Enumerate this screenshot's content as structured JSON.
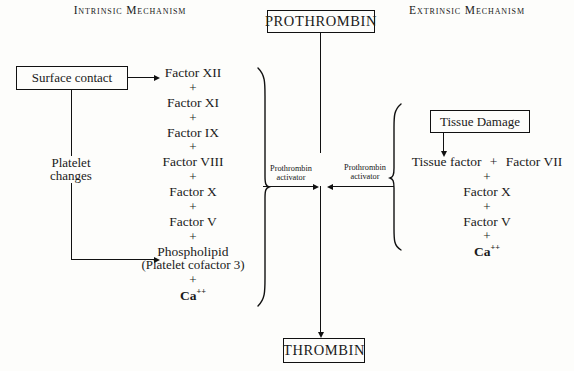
{
  "headers": {
    "intrinsic": "Intrinsic Mechanism",
    "extrinsic": "Extrinsic Mechanism"
  },
  "boxes": {
    "prothrombin": "PROTHROMBIN",
    "thrombin": "THROMBIN",
    "surface_contact": "Surface contact",
    "tissue_damage": "Tissue Damage"
  },
  "intrinsic": {
    "platelet_changes_line1": "Platelet",
    "platelet_changes_line2": "changes",
    "cascade": [
      "Factor XII",
      "Factor XI",
      "Factor IX",
      "Factor VIII",
      "Factor X",
      "Factor V",
      "Phospholipid",
      "Ca++"
    ],
    "phospholipid_sub": "(Platelet  cofactor 3)",
    "ca_base": "Ca",
    "ca_sup": "++",
    "plus": "+"
  },
  "extrinsic": {
    "tissue_factor": "Tissue factor",
    "factor_vii": "Factor VII",
    "cascade": [
      "Factor X",
      "Factor V",
      "Ca++"
    ],
    "ca_base": "Ca",
    "ca_sup": "++",
    "plus": "+"
  },
  "activators": {
    "left_line1": "Prothrombin",
    "left_line2": "activator",
    "right_line1": "Prothrombin",
    "right_line2": "activator"
  },
  "colors": {
    "ink": "#111111",
    "paper": "#fdfdfb"
  }
}
